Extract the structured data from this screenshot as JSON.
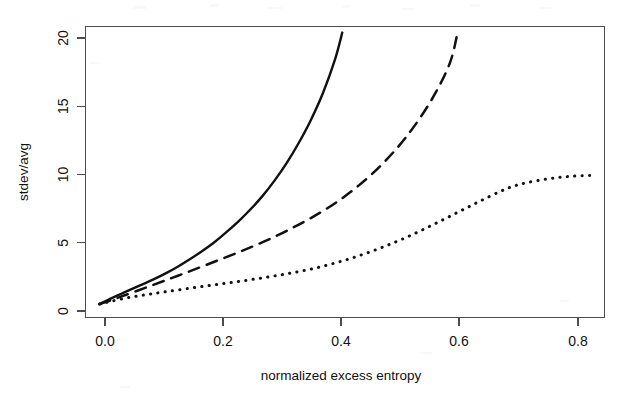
{
  "figure": {
    "background_color": "#ffffff",
    "ink_color": "#111111",
    "axis_color": "#4d4d4d"
  },
  "chart_data": {
    "type": "line",
    "title": "",
    "subtitle": "",
    "xlabel": "normalized excess entropy",
    "ylabel": "stdev/avg",
    "xlim": [
      -0.0135,
      0.8465
    ],
    "ylim": [
      -0.6,
      21.05
    ],
    "xticks": [
      0.0,
      0.2,
      0.4,
      0.6,
      0.8
    ],
    "xtick_labels": [
      "0.0",
      "0.2",
      "0.4",
      "0.6",
      "0.8"
    ],
    "yticks": [
      0,
      5,
      10,
      15,
      20
    ],
    "ytick_labels": [
      "0",
      "5",
      "10",
      "15",
      "20"
    ],
    "grid": false,
    "legend": null,
    "legend_position": "none",
    "box": true,
    "series": [
      {
        "name": "solid",
        "linestyle": "solid",
        "color": "#111111",
        "x": [
          0.01,
          0.02,
          0.03,
          0.045,
          0.06,
          0.08,
          0.1,
          0.12,
          0.14,
          0.16,
          0.18,
          0.2,
          0.22,
          0.24,
          0.26,
          0.28,
          0.3,
          0.32,
          0.34,
          0.36,
          0.38,
          0.4,
          0.412
        ],
        "y": [
          0.4,
          0.62,
          0.84,
          1.15,
          1.45,
          1.85,
          2.25,
          2.7,
          3.2,
          3.75,
          4.35,
          5.0,
          5.75,
          6.55,
          7.45,
          8.45,
          9.6,
          10.9,
          12.4,
          14.1,
          16.1,
          18.6,
          20.6
        ]
      },
      {
        "name": "dashed",
        "linestyle": "dashed",
        "color": "#111111",
        "x": [
          0.01,
          0.025,
          0.045,
          0.07,
          0.1,
          0.13,
          0.16,
          0.2,
          0.24,
          0.28,
          0.32,
          0.36,
          0.4,
          0.44,
          0.48,
          0.52,
          0.56,
          0.59,
          0.603
        ],
        "y": [
          0.4,
          0.62,
          0.95,
          1.35,
          1.85,
          2.35,
          2.85,
          3.55,
          4.25,
          5.0,
          5.85,
          6.8,
          7.9,
          9.25,
          10.9,
          12.95,
          15.6,
          18.3,
          20.6
        ]
      },
      {
        "name": "dotted",
        "linestyle": "dotted",
        "color": "#111111",
        "x": [
          0.01,
          0.03,
          0.06,
          0.09,
          0.12,
          0.16,
          0.2,
          0.24,
          0.28,
          0.32,
          0.36,
          0.4,
          0.44,
          0.48,
          0.52,
          0.56,
          0.6,
          0.64,
          0.68,
          0.71,
          0.75,
          0.79,
          0.83
        ],
        "y": [
          0.4,
          0.62,
          0.9,
          1.12,
          1.32,
          1.58,
          1.83,
          2.08,
          2.35,
          2.65,
          3.0,
          3.45,
          4.0,
          4.65,
          5.4,
          6.25,
          7.15,
          8.05,
          8.9,
          9.35,
          9.7,
          9.9,
          9.98
        ]
      }
    ]
  },
  "annotations": []
}
